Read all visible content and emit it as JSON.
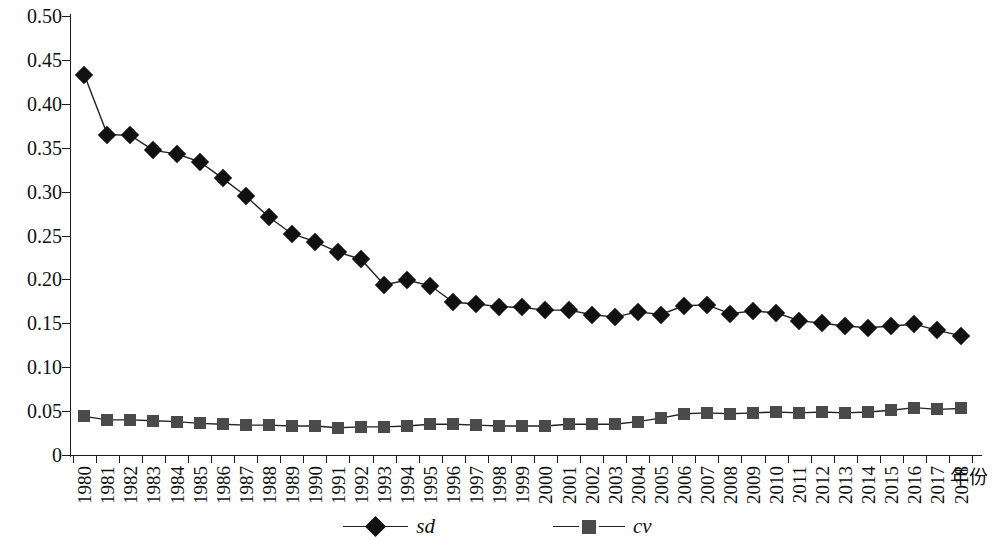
{
  "chart_data": {
    "type": "line",
    "title": "",
    "xlabel": "年份",
    "ylabel": "",
    "ylim": [
      0,
      0.5
    ],
    "grid": false,
    "legend_position": "bottom-center",
    "y_ticks": [
      "0",
      "0.05",
      "0.10",
      "0.15",
      "0.20",
      "0.25",
      "0.30",
      "0.35",
      "0.40",
      "0.45",
      "0.50"
    ],
    "y_tick_values": [
      0,
      0.05,
      0.1,
      0.15,
      0.2,
      0.25,
      0.3,
      0.35,
      0.4,
      0.45,
      0.5
    ],
    "categories": [
      "1980",
      "1981",
      "1982",
      "1983",
      "1984",
      "1985",
      "1986",
      "1987",
      "1988",
      "1989",
      "1990",
      "1991",
      "1992",
      "1993",
      "1994",
      "1995",
      "1996",
      "1997",
      "1998",
      "1999",
      "2000",
      "2001",
      "2002",
      "2003",
      "2004",
      "2005",
      "2006",
      "2007",
      "2008",
      "2009",
      "2010",
      "2011",
      "2012",
      "2013",
      "2014",
      "2015",
      "2016",
      "2017",
      "2018"
    ],
    "series": [
      {
        "name": "sd",
        "marker": "diamond",
        "color": "#111111",
        "values": [
          0.433,
          0.365,
          0.364,
          0.347,
          0.343,
          0.334,
          0.315,
          0.295,
          0.271,
          0.252,
          0.243,
          0.231,
          0.223,
          0.194,
          0.199,
          0.193,
          0.174,
          0.172,
          0.169,
          0.168,
          0.165,
          0.165,
          0.16,
          0.157,
          0.163,
          0.16,
          0.17,
          0.171,
          0.161,
          0.164,
          0.162,
          0.153,
          0.15,
          0.147,
          0.145,
          0.147,
          0.149,
          0.142,
          0.136
        ]
      },
      {
        "name": "cv",
        "marker": "square",
        "color": "#4a4a4a",
        "values": [
          0.044,
          0.04,
          0.04,
          0.039,
          0.038,
          0.036,
          0.035,
          0.034,
          0.034,
          0.033,
          0.033,
          0.031,
          0.032,
          0.032,
          0.033,
          0.035,
          0.035,
          0.034,
          0.033,
          0.033,
          0.033,
          0.035,
          0.035,
          0.035,
          0.038,
          0.042,
          0.047,
          0.048,
          0.047,
          0.048,
          0.049,
          0.048,
          0.049,
          0.048,
          0.049,
          0.051,
          0.054,
          0.052,
          0.053
        ]
      }
    ]
  },
  "legend": {
    "entries": [
      {
        "label": "sd"
      },
      {
        "label": "cv"
      }
    ]
  },
  "axis": {
    "x_title": "年份"
  }
}
